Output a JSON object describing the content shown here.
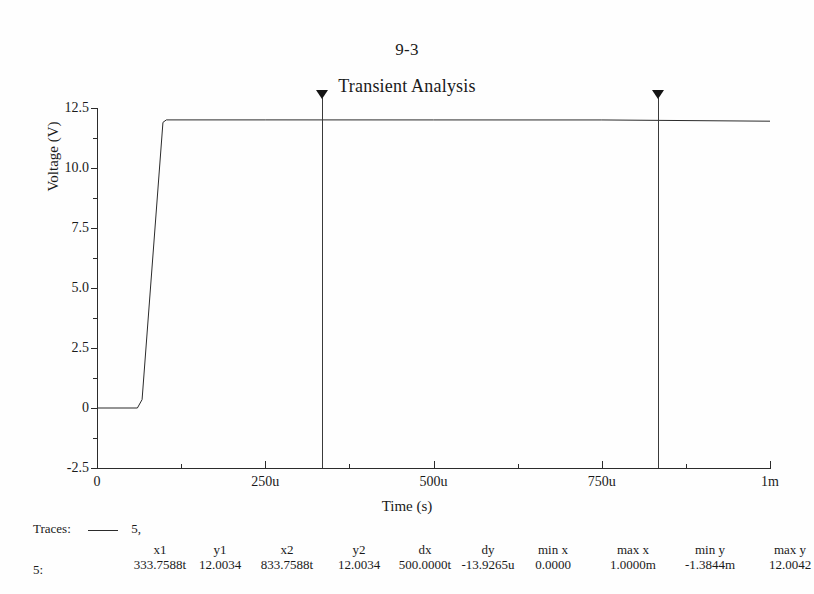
{
  "document": {
    "number": "9-3"
  },
  "chart_data": {
    "type": "line",
    "title": "Transient Analysis",
    "xlabel": "Time (s)",
    "ylabel": "Voltage (V)",
    "xlim": [
      0,
      0.001
    ],
    "ylim": [
      -2.5,
      12.5
    ],
    "grid": false,
    "legend_position": "below-plot",
    "x_ticks": [
      {
        "value": 0,
        "label": "0"
      },
      {
        "value": 0.00025,
        "label": "250u"
      },
      {
        "value": 0.0005,
        "label": "500u"
      },
      {
        "value": 0.00075,
        "label": "750u"
      },
      {
        "value": 0.001,
        "label": "1m"
      }
    ],
    "y_ticks": [
      {
        "value": 12.5,
        "label": "12.5"
      },
      {
        "value": 10.0,
        "label": "10.0"
      },
      {
        "value": 7.5,
        "label": "7.5"
      },
      {
        "value": 5.0,
        "label": "5.0"
      },
      {
        "value": 2.5,
        "label": "2.5"
      },
      {
        "value": 0,
        "label": "0"
      },
      {
        "value": -2.5,
        "label": "-2.5"
      }
    ],
    "series": [
      {
        "name": "5",
        "color": "#2b2b2b",
        "x": [
          0,
          6e-05,
          6.7e-05,
          9.8e-05,
          0.000103,
          0.00025,
          0.0005,
          0.00075,
          0.001
        ],
        "y": [
          0.0,
          0.0,
          0.35,
          11.9,
          12.004,
          12.004,
          12.003,
          12.002,
          11.95
        ]
      }
    ],
    "cursors": [
      {
        "name": "cursor-1",
        "x": 0.0003337588,
        "label": "x1"
      },
      {
        "name": "cursor-2",
        "x": 0.0008337588,
        "label": "x2"
      }
    ]
  },
  "legend": {
    "traces_label": "Traces:",
    "trace_name": "5,"
  },
  "readout": {
    "row_label": "5:",
    "columns": [
      {
        "header": "x1",
        "value": "333.7588t"
      },
      {
        "header": "y1",
        "value": "12.0034"
      },
      {
        "header": "x2",
        "value": "833.7588t"
      },
      {
        "header": "y2",
        "value": "12.0034"
      },
      {
        "header": "dx",
        "value": "500.0000t"
      },
      {
        "header": "dy",
        "value": "-13.9265u"
      },
      {
        "header": "min x",
        "value": "0.0000"
      },
      {
        "header": "max x",
        "value": "1.0000m"
      },
      {
        "header": "min y",
        "value": "-1.3844m"
      },
      {
        "header": "max y",
        "value": "12.0042"
      }
    ]
  },
  "colors": {
    "trace": "#2b2b2b",
    "axis": "#2b2b2b",
    "cursor": "#3a3a3a",
    "background": "#fefefe"
  }
}
